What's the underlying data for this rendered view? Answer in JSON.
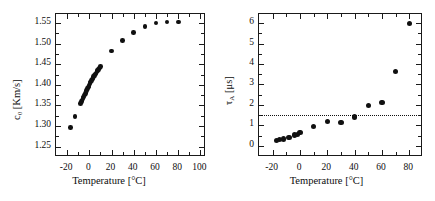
{
  "figure": {
    "panels": [
      {
        "id": "panel-a",
        "axis": {
          "xlabel": "Temperature [°C]",
          "ylabel_main": "c",
          "ylabel_sub": "0",
          "ylabel_unit": " [Km/s]",
          "ylabel_full": "c0 [Km/s]",
          "xticks": [
            -20,
            0,
            20,
            40,
            60,
            80,
            100
          ],
          "xticklabels": [
            "-20",
            "0",
            "20",
            "40",
            "60",
            "80",
            "100"
          ],
          "yticks": [
            1.25,
            1.3,
            1.35,
            1.4,
            1.45,
            1.5,
            1.55
          ],
          "yticklabels": [
            "1.25",
            "1.30",
            "1.35",
            "1.40",
            "1.45",
            "1.50",
            "1.55"
          ],
          "xlim": [
            -30,
            105
          ],
          "ylim": [
            1.225,
            1.572
          ],
          "x_minor_step": 10,
          "y_minor_step": 0.025
        }
      },
      {
        "id": "panel-b",
        "axis": {
          "xlabel": "Temperature [°C]",
          "ylabel_main": "τ",
          "ylabel_sub": "A",
          "ylabel_unit": " [μs]",
          "ylabel_full": "τA [μs]",
          "xticks": [
            -20,
            0,
            20,
            40,
            60,
            80
          ],
          "xticklabels": [
            "-20",
            "0",
            "20",
            "40",
            "60",
            "80"
          ],
          "yticks": [
            0,
            1,
            2,
            3,
            4,
            5,
            6
          ],
          "yticklabels": [
            "0",
            "1",
            "2",
            "3",
            "4",
            "5",
            "6"
          ],
          "xlim": [
            -30,
            90
          ],
          "ylim": [
            -0.55,
            6.45
          ],
          "x_minor_step": 10,
          "y_minor_step": 0.5
        }
      }
    ]
  },
  "chart_data": [
    {
      "type": "scatter",
      "panel": "panel-a",
      "title": "",
      "xlabel": "Temperature [°C]",
      "ylabel": "c0 [Km/s]",
      "xlim": [
        -30,
        105
      ],
      "ylim": [
        1.225,
        1.572
      ],
      "grid": false,
      "legend": null,
      "marker": "filled-circle",
      "color": "#101010",
      "series": [
        {
          "name": "c0",
          "x": [
            -17.0,
            -13.0,
            -8.0,
            -7.2,
            -6.5,
            -5.8,
            -5.1,
            -4.4,
            -3.7,
            -3.0,
            -2.3,
            -1.6,
            -0.9,
            -0.2,
            0.5,
            1.2,
            1.9,
            2.6,
            3.3,
            4.0,
            4.7,
            5.4,
            6.1,
            6.8,
            7.5,
            8.2,
            8.9,
            9.6,
            10.0,
            20.0,
            30.0,
            40.0,
            50.0,
            60.0,
            70.0,
            80.0
          ],
          "y": [
            1.297,
            1.323,
            1.355,
            1.359,
            1.363,
            1.367,
            1.371,
            1.375,
            1.379,
            1.383,
            1.387,
            1.391,
            1.395,
            1.399,
            1.403,
            1.407,
            1.41,
            1.414,
            1.417,
            1.42,
            1.423,
            1.426,
            1.429,
            1.432,
            1.435,
            1.438,
            1.441,
            1.443,
            1.445,
            1.482,
            1.508,
            1.527,
            1.541,
            1.55,
            1.553,
            1.553
          ]
        }
      ]
    },
    {
      "type": "scatter",
      "panel": "panel-b",
      "title": "",
      "xlabel": "Temperature [°C]",
      "ylabel": "τA [μs]",
      "xlim": [
        -30,
        90
      ],
      "ylim": [
        -0.55,
        6.45
      ],
      "grid": false,
      "legend": null,
      "marker": "filled-circle",
      "color": "#101010",
      "reference_line": {
        "orientation": "horizontal",
        "y": 1.5,
        "style": "dotted",
        "color": "#111111"
      },
      "series": [
        {
          "name": "tauA",
          "x": [
            -17.0,
            -15.0,
            -12.0,
            -8.0,
            -4.0,
            -2.0,
            0.0,
            10.0,
            20.0,
            30.0,
            40.0,
            50.0,
            60.0,
            70.0,
            80.0
          ],
          "y": [
            0.26,
            0.3,
            0.33,
            0.4,
            0.52,
            0.56,
            0.66,
            0.95,
            1.2,
            1.13,
            1.4,
            1.97,
            2.11,
            3.65,
            6.0
          ]
        }
      ]
    }
  ]
}
